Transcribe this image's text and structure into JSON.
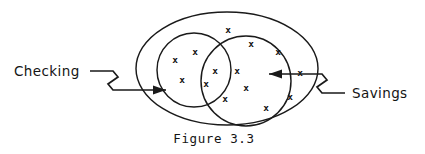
{
  "figure": {
    "caption": "Figure 3.3",
    "caption_x": 214,
    "caption_y": 143,
    "background_color": "#ffffff",
    "ink_color": "#1a1a1a"
  },
  "labels": {
    "left": {
      "text": "Checking",
      "x": 14,
      "y": 76,
      "icon": "text-label"
    },
    "right": {
      "text": "Savings",
      "x": 352,
      "y": 98,
      "icon": "text-label"
    }
  },
  "shapes": {
    "universe_ellipse": {
      "name": "outer-ellipse-universe",
      "cx": 227,
      "cy": 68.5,
      "rx": 91,
      "ry": 56.5
    },
    "left_circle": {
      "name": "left-circle-checking",
      "cx": 194,
      "cy": 70,
      "r": 37
    },
    "right_circle": {
      "name": "right-circle-savings",
      "cx": 246,
      "cy": 81,
      "r": 45
    }
  },
  "leaders": {
    "left": {
      "path": "M 90 71 L 113 71 L 118 77 L 108 84 L 113 90 L 166 90",
      "arrow": "166,90 153,85.5 153,94.5",
      "arrow_direction": "right"
    },
    "right": {
      "path": "M 345 93 L 322 93 L 317 87 L 327 80 L 322 74 L 269 74",
      "arrow": "269,74 282,69.5 282,78.5",
      "arrow_direction": "left"
    }
  },
  "x_marks": {
    "glyph": "x",
    "outer_only": [
      {
        "x": 228,
        "y": 29
      },
      {
        "x": 251,
        "y": 43
      },
      {
        "x": 278,
        "y": 51
      },
      {
        "x": 300,
        "y": 72
      },
      {
        "x": 290,
        "y": 96
      },
      {
        "x": 266,
        "y": 107
      }
    ],
    "left_only": [
      {
        "x": 195,
        "y": 51
      },
      {
        "x": 175,
        "y": 59
      },
      {
        "x": 182,
        "y": 79
      }
    ],
    "intersection": [
      {
        "x": 215,
        "y": 70
      },
      {
        "x": 206,
        "y": 83
      }
    ],
    "right_only": [
      {
        "x": 237,
        "y": 70
      },
      {
        "x": 246,
        "y": 87
      },
      {
        "x": 225,
        "y": 98
      }
    ],
    "counts": {
      "outer_only": 6,
      "left_only": 3,
      "intersection": 2,
      "right_only": 3,
      "total": 14
    }
  }
}
